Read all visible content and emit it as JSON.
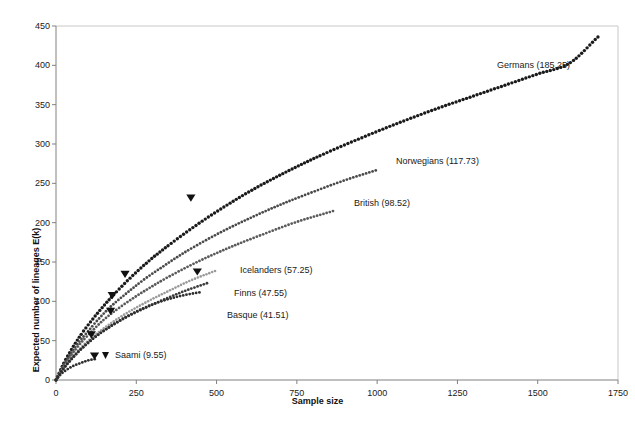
{
  "chart_data": {
    "type": "line",
    "title": "",
    "xlabel": "Sample size",
    "ylabel": "Expected number of lineages E(k)",
    "xlim": [
      0,
      1750
    ],
    "ylim": [
      0,
      450
    ],
    "xticks": [
      0,
      250,
      500,
      750,
      1000,
      1250,
      1500,
      1750
    ],
    "yticks": [
      0,
      50,
      100,
      150,
      200,
      250,
      300,
      350,
      400,
      450
    ],
    "xtick_labels": [
      "0",
      "250",
      "500",
      "750",
      "1000",
      "1250",
      "1500",
      "1750"
    ],
    "ytick_labels": [
      "0",
      "50",
      "100",
      "150",
      "200",
      "250",
      "300",
      "350",
      "400",
      "450"
    ],
    "grid": false,
    "legend_position": "inline-end-of-curve",
    "marker": "triangle-down",
    "line_style": "dotted",
    "series": [
      {
        "name": "Germans",
        "label": "Germans (185.25)",
        "value": 185.25,
        "marker_x": 420,
        "marker_y": 228,
        "x_end": 1690,
        "y_end": 437,
        "label_x": 497,
        "label_y": 60,
        "color": "#1a1a1a",
        "dot_size": 1.7,
        "dot_gap": 3.4,
        "points_x": [
          0,
          25,
          50,
          75,
          100,
          150,
          200,
          250,
          300,
          350,
          420,
          500,
          600,
          700,
          800,
          900,
          1000,
          1100,
          1200,
          1300,
          1400,
          1500,
          1600,
          1690
        ],
        "points_y": [
          0,
          22,
          40,
          56,
          70,
          95,
          117,
          137,
          155,
          171,
          192,
          214,
          239,
          261,
          281,
          299,
          316,
          332,
          347,
          361,
          375,
          389,
          403,
          437
        ]
      },
      {
        "name": "Norwegians",
        "label": "Norwegians (117.73)",
        "value": 117.73,
        "marker_x": 175,
        "marker_y": 104,
        "x_end": 1000,
        "y_end": 267,
        "label_x": 396,
        "label_y": 156,
        "color": "#4a4a4a",
        "dot_size": 1.4,
        "dot_gap": 3.2,
        "points_x": [
          0,
          25,
          50,
          75,
          100,
          125,
          150,
          175,
          225,
          275,
          325,
          400,
          500,
          600,
          700,
          800,
          900,
          1000
        ],
        "points_y": [
          0,
          20,
          36,
          50,
          62,
          74,
          85,
          95,
          112,
          128,
          142,
          162,
          185,
          205,
          223,
          239,
          254,
          267
        ]
      },
      {
        "name": "British",
        "label": "British (98.52)",
        "value": 98.52,
        "marker_x": 215,
        "marker_y": 131,
        "x_end": 865,
        "y_end": 215,
        "label_x": 354,
        "label_y": 198,
        "color": "#5a5a5a",
        "dot_size": 1.4,
        "dot_gap": 3.2,
        "points_x": [
          0,
          25,
          50,
          75,
          100,
          150,
          215,
          275,
          350,
          450,
          550,
          650,
          750,
          865
        ],
        "points_y": [
          0,
          18,
          33,
          46,
          57,
          77,
          97,
          113,
          131,
          152,
          170,
          186,
          201,
          215
        ]
      },
      {
        "name": "Icelanders",
        "label": "Icelanders (57.25)",
        "value": 57.25,
        "marker_x": 440,
        "marker_y": 134,
        "x_end": 498,
        "y_end": 139,
        "label_x": 240,
        "label_y": 265,
        "color": "#9a9a9a",
        "dot_size": 1.3,
        "dot_gap": 3.0,
        "points_x": [
          0,
          25,
          50,
          75,
          100,
          150,
          200,
          250,
          300,
          350,
          400,
          440,
          498
        ],
        "points_y": [
          0,
          16,
          29,
          40,
          50,
          66,
          80,
          92,
          103,
          113,
          123,
          130,
          139
        ]
      },
      {
        "name": "Finns",
        "label": "Finns (47.55)",
        "value": 47.55,
        "marker_x": 170,
        "marker_y": 84,
        "x_end": 470,
        "y_end": 123,
        "label_x": 234,
        "label_y": 288,
        "color": "#3c3c3c",
        "dot_size": 1.4,
        "dot_gap": 3.2,
        "points_x": [
          0,
          25,
          50,
          75,
          100,
          130,
          170,
          220,
          280,
          340,
          400,
          470
        ],
        "points_y": [
          0,
          15,
          27,
          38,
          47,
          57,
          68,
          80,
          92,
          103,
          113,
          123
        ]
      },
      {
        "name": "Basque",
        "label": "Basque (41.51)",
        "value": 41.51,
        "marker_x": 110,
        "marker_y": 54,
        "x_end": 455,
        "y_end": 112,
        "label_x": 227,
        "label_y": 310,
        "color": "#2e2e2e",
        "dot_size": 1.4,
        "dot_gap": 3.2,
        "points_x": [
          0,
          20,
          40,
          60,
          80,
          110,
          150,
          200,
          260,
          320,
          390,
          455
        ],
        "points_y": [
          0,
          13,
          23,
          32,
          40,
          51,
          63,
          76,
          89,
          99,
          107,
          112
        ]
      },
      {
        "name": "Saami",
        "label": "Saami (9.55)",
        "value": 9.55,
        "marker_x": 120,
        "marker_y": 27,
        "x_end": 130,
        "y_end": 27,
        "label_x": 115,
        "label_y": 350,
        "color": "#2e2e2e",
        "dot_size": 1.4,
        "dot_gap": 3.2,
        "points_x": [
          0,
          10,
          20,
          30,
          45,
          60,
          80,
          100,
          120,
          130
        ],
        "points_y": [
          0,
          5,
          9,
          12,
          16,
          19,
          22,
          25,
          26.5,
          27
        ]
      }
    ]
  },
  "axes": {
    "plot_left": 56,
    "plot_right": 618,
    "plot_top": 26,
    "plot_bottom": 380,
    "frame_color": "#c8c8c8",
    "axis_color": "#808080"
  }
}
